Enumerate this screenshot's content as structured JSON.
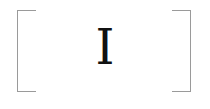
{
  "symbol": {
    "text": "I"
  },
  "colors": {
    "bracket": "#9a9a9a",
    "text": "#111111",
    "background": "#ffffff"
  }
}
